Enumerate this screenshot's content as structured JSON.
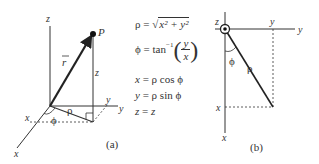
{
  "diagram_a": {
    "caption": "(a)",
    "axis_labels": {
      "x": "x",
      "y": "y",
      "z": "z"
    },
    "point_label": "P",
    "vector_label": "r",
    "height_label": "z",
    "radius_label": "ρ",
    "angle_label": "ϕ",
    "projection_x_label": "x",
    "projection_y_label": "y"
  },
  "equations": {
    "rho": {
      "lhs": "ρ",
      "eq": "=",
      "rhs_prefix": "√",
      "rhs": "x² + y²"
    },
    "phi": {
      "lhs": "ϕ",
      "eq": "=",
      "func": "tan",
      "sup": "−1",
      "num": "y",
      "den": "x"
    },
    "x": {
      "lhs": "x",
      "eq": "=",
      "rhs": "ρ cos ϕ"
    },
    "y": {
      "lhs": "y",
      "eq": "=",
      "rhs": "ρ sin ϕ"
    },
    "z": {
      "lhs": "z",
      "eq": "=",
      "rhs": "z"
    }
  },
  "diagram_b": {
    "caption": "(b)",
    "axis_labels": {
      "x": "x",
      "y": "y",
      "z": "z"
    },
    "radius_label": "ρ",
    "angle_label": "ϕ",
    "projection_x_label": "x",
    "projection_y_label": "y"
  }
}
